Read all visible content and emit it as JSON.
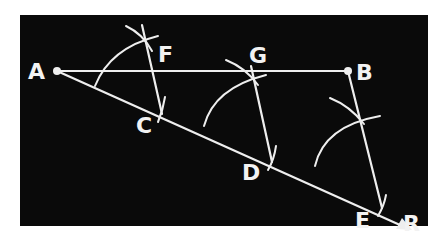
{
  "diagram": {
    "background": "#0a0a0a",
    "stroke_color": "#eeeeee",
    "points": [
      {
        "name": "A",
        "x": 57,
        "y": 71
      },
      {
        "name": "B",
        "x": 348,
        "y": 71
      },
      {
        "name": "F",
        "x": 142,
        "y": 34
      },
      {
        "name": "G",
        "x": 252,
        "y": 76
      },
      {
        "name": "C",
        "x": 162,
        "y": 112
      },
      {
        "name": "D",
        "x": 272,
        "y": 160
      },
      {
        "name": "E",
        "x": 382,
        "y": 206
      },
      {
        "name": "R",
        "x": 404,
        "y": 218
      }
    ],
    "labels": [
      {
        "text": "A",
        "x": 28,
        "y": 79
      },
      {
        "text": "F",
        "x": 158,
        "y": 62
      },
      {
        "text": "G",
        "x": 250,
        "y": 62
      },
      {
        "text": "B",
        "x": 356,
        "y": 80
      },
      {
        "text": "C",
        "x": 136,
        "y": 133
      },
      {
        "text": "D",
        "x": 242,
        "y": 180
      },
      {
        "text": "E",
        "x": 356,
        "y": 227
      },
      {
        "text": "R",
        "x": 402,
        "y": 232
      }
    ],
    "segments": [
      {
        "from": "A",
        "to": "B",
        "label": "AB"
      },
      {
        "from": "A",
        "to": "R",
        "label": "AR"
      },
      {
        "from": "F",
        "to": "C",
        "label": "FC"
      },
      {
        "from": "G",
        "to": "D",
        "label": "GD"
      },
      {
        "from": "B",
        "to": "E",
        "label": "BE"
      }
    ]
  }
}
